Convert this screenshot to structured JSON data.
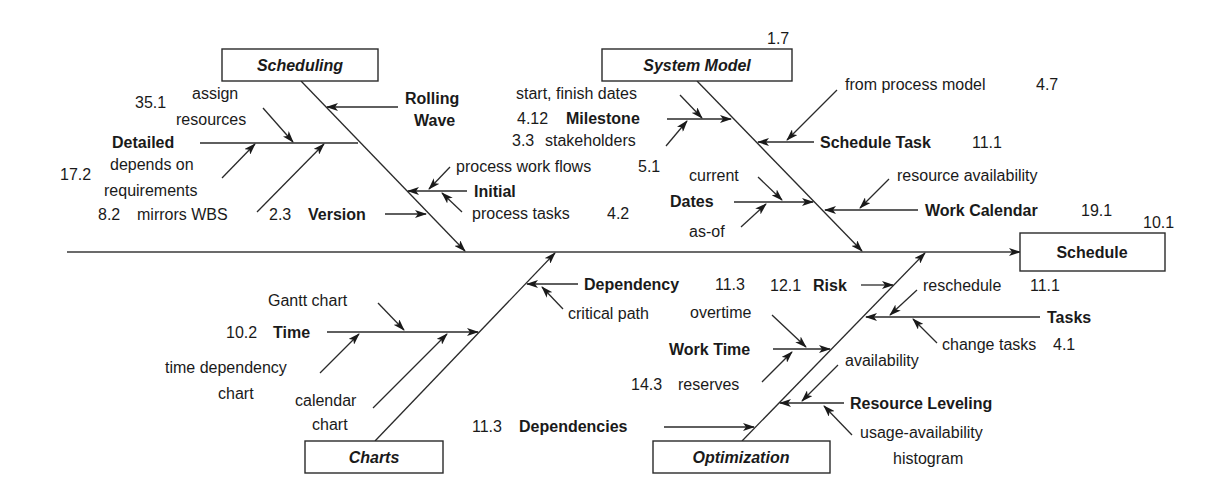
{
  "diagram": {
    "type": "fishbone",
    "effect": {
      "label": "Schedule",
      "ref": "10.1"
    },
    "categories": {
      "scheduling": {
        "label": "Scheduling",
        "causes": {
          "rolling_wave": {
            "label_1": "Rolling",
            "label_2": "Wave"
          },
          "detailed": {
            "label": "Detailed",
            "sub_assign": {
              "ref": "35.1",
              "line_1": "assign",
              "line_2": "resources"
            },
            "sub_depends": {
              "ref": "17.2",
              "line_1": "depends on",
              "line_2": "requirements"
            },
            "sub_wbs": {
              "ref": "8.2",
              "text": "mirrors WBS"
            }
          },
          "initial": {
            "label": "Initial",
            "sub_workflows": {
              "text": "process work flows",
              "ref": "5.1"
            },
            "sub_tasks": {
              "text": "process tasks",
              "ref": "4.2"
            }
          },
          "version": {
            "ref": "2.3",
            "label": "Version"
          }
        }
      },
      "system_model": {
        "label": "System Model",
        "ref": "1.7",
        "causes": {
          "milestone": {
            "ref": "4.12",
            "label": "Milestone",
            "sub_dates": {
              "text": "start, finish dates"
            },
            "sub_stakeholders": {
              "ref": "3.3",
              "text": "stakeholders"
            }
          },
          "schedule_task": {
            "label": "Schedule Task",
            "ref": "11.1",
            "sub_process": {
              "text": "from process model",
              "ref": "4.7"
            }
          },
          "dates": {
            "label": "Dates",
            "sub_current": {
              "text": "current"
            },
            "sub_asof": {
              "text": "as-of"
            }
          },
          "work_calendar": {
            "label": "Work Calendar",
            "ref": "19.1",
            "sub_resource": {
              "text": "resource availability"
            }
          }
        }
      },
      "charts": {
        "label": "Charts",
        "causes": {
          "time": {
            "ref": "10.2",
            "label": "Time",
            "sub_gantt": {
              "text": "Gantt chart"
            },
            "sub_tdc": {
              "line_1": "time dependency",
              "line_2": "chart"
            },
            "sub_calendar": {
              "line_1": "calendar",
              "line_2": "chart"
            }
          },
          "dependency": {
            "label": "Dependency",
            "ref": "11.3",
            "sub_critical": {
              "text": "critical path"
            }
          }
        }
      },
      "optimization": {
        "label": "Optimization",
        "causes": {
          "risk": {
            "ref": "12.1",
            "label": "Risk"
          },
          "tasks": {
            "label": "Tasks",
            "sub_reschedule": {
              "text": "reschedule",
              "ref": "11.1"
            },
            "sub_change": {
              "text": "change tasks",
              "ref": "4.1"
            }
          },
          "work_time": {
            "label": "Work Time",
            "sub_overtime": {
              "text": "overtime"
            },
            "sub_reserves": {
              "ref": "14.3",
              "text": "reserves"
            }
          },
          "resource_leveling": {
            "label": "Resource Leveling",
            "sub_availability": {
              "text": "availability"
            },
            "sub_histogram": {
              "line_1": "usage-availability",
              "line_2": "histogram"
            }
          },
          "dependencies": {
            "ref": "11.3",
            "label": "Dependencies"
          }
        }
      }
    }
  }
}
